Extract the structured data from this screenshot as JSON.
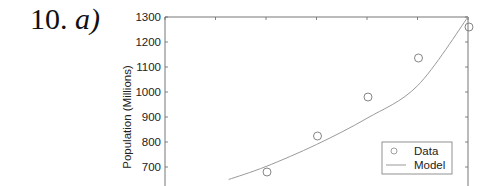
{
  "problem": {
    "number": "10.",
    "part": "a)"
  },
  "chart_data": {
    "type": "scatter",
    "title": "",
    "xlabel": "",
    "ylabel": "Population (Millions)",
    "ylim": [
      650,
      1300
    ],
    "yticks": [
      700,
      800,
      900,
      1000,
      1100,
      1200,
      1300
    ],
    "x_tick_count_visible": 7,
    "grid": false,
    "legend_position": "lower right",
    "series": [
      {
        "name": "Data",
        "style": "open-circle-markers",
        "x_index": [
          2,
          3,
          4,
          5,
          6
        ],
        "values": [
          680,
          824,
          980,
          1136,
          1260
        ]
      },
      {
        "name": "Model",
        "style": "line",
        "x_index": [
          1.26,
          2,
          3,
          4,
          5,
          6
        ],
        "values": [
          650,
          702,
          790,
          895,
          1025,
          1300
        ]
      }
    ],
    "colors": {
      "data": "#777777",
      "model": "#9a9a9a",
      "axis": "#666666"
    }
  },
  "legend": {
    "items": [
      {
        "label": "Data"
      },
      {
        "label": "Model"
      }
    ]
  }
}
